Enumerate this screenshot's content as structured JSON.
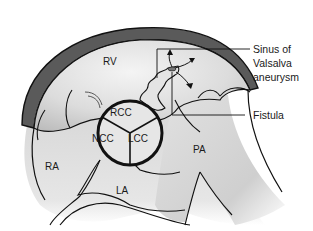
{
  "diagram": {
    "type": "anatomical-illustration",
    "chambers": {
      "rv": "RV",
      "ra": "RA",
      "la": "LA",
      "pa": "PA"
    },
    "aortic_cusps": {
      "rcc": "RCC",
      "ncc": "NCC",
      "lcc": "LCC"
    },
    "callouts": {
      "aneurysm_line1": "Sinus of",
      "aneurysm_line2": "Valsalva",
      "aneurysm_line3": "aneurysm",
      "fistula": "Fistula"
    },
    "colors": {
      "outline": "#111111",
      "wall_dark": "#5a5a5a",
      "tissue_light": "#e8e8e8",
      "tissue_mid": "#cfcfcf",
      "background": "#ffffff"
    }
  }
}
